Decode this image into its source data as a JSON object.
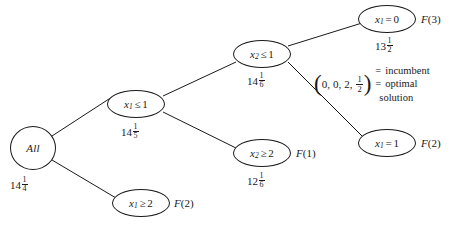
{
  "figure": {
    "background_color": "#ffffff",
    "line_color": "#1a1a1a"
  },
  "nodes": [
    {
      "id": "root",
      "label": "All",
      "label_plain": "All",
      "shape": "circle",
      "cx": 33,
      "cy": 148,
      "rx": 23,
      "ry": 22,
      "bound": {
        "whole": "14",
        "numer": "1",
        "denom": "4",
        "x": 10,
        "y": 176
      },
      "fn_label": null
    },
    {
      "id": "x1le1",
      "var": "x",
      "sub": "1",
      "op": "≤",
      "value": "1",
      "label_plain": "x1 ≤ 1",
      "shape": "ellipse",
      "cx": 136,
      "cy": 104,
      "rx": 29,
      "ry": 14,
      "bound": {
        "whole": "14",
        "numer": "1",
        "denom": "5",
        "x": 121,
        "y": 123
      },
      "fn_label": null
    },
    {
      "id": "x1ge2",
      "var": "x",
      "sub": "1",
      "op": "≥",
      "value": "2",
      "label_plain": "x1 ≥ 2",
      "shape": "ellipse",
      "cx": 141,
      "cy": 203,
      "rx": 29,
      "ry": 14,
      "bound": null,
      "fn_label": {
        "name": "F",
        "arg": "2",
        "x": 174,
        "y": 197
      }
    },
    {
      "id": "x2le1",
      "var": "x",
      "sub": "2",
      "op": "≤",
      "value": "1",
      "label_plain": "x2 ≤ 1",
      "shape": "ellipse",
      "cx": 262,
      "cy": 54,
      "rx": 29,
      "ry": 14,
      "bound": {
        "whole": "14",
        "numer": "1",
        "denom": "6",
        "x": 247,
        "y": 72
      },
      "fn_label": null
    },
    {
      "id": "x2ge2",
      "var": "x",
      "sub": "2",
      "op": "≥",
      "value": "2",
      "label_plain": "x2 ≥ 2",
      "shape": "ellipse",
      "cx": 262,
      "cy": 153,
      "rx": 29,
      "ry": 14,
      "bound": {
        "whole": "12",
        "numer": "1",
        "denom": "6",
        "x": 247,
        "y": 172
      },
      "fn_label": {
        "name": "F",
        "arg": "1",
        "x": 296,
        "y": 147
      }
    },
    {
      "id": "x1eq0",
      "var": "x",
      "sub": "1",
      "op": "=",
      "value": "0",
      "label_plain": "x1 = 0",
      "shape": "ellipse",
      "cx": 387,
      "cy": 19,
      "rx": 29,
      "ry": 14,
      "bound": {
        "whole": "13",
        "numer": "1",
        "denom": "2",
        "x": 375,
        "y": 37
      },
      "fn_label": {
        "name": "F",
        "arg": "3",
        "x": 421,
        "y": 13
      }
    },
    {
      "id": "x1eq1",
      "var": "x",
      "sub": "1",
      "op": "=",
      "value": "1",
      "label_plain": "x1 = 1",
      "shape": "ellipse",
      "cx": 387,
      "cy": 143,
      "rx": 29,
      "ry": 14,
      "bound": null,
      "fn_label": {
        "name": "F",
        "arg": "2",
        "x": 421,
        "y": 137
      }
    }
  ],
  "edges": [
    {
      "from": "root",
      "to": "x1le1",
      "x1": 52,
      "y1": 136,
      "x2": 112,
      "y2": 97
    },
    {
      "from": "root",
      "to": "x1ge2",
      "x1": 52,
      "y1": 160,
      "x2": 116,
      "y2": 198
    },
    {
      "from": "x1le1",
      "to": "x2le1",
      "x1": 163,
      "y1": 96,
      "x2": 236,
      "y2": 62
    },
    {
      "from": "x1le1",
      "to": "x2ge2",
      "x1": 163,
      "y1": 112,
      "x2": 236,
      "y2": 148
    },
    {
      "from": "x2le1",
      "to": "x1eq0",
      "x1": 288,
      "y1": 46,
      "x2": 362,
      "y2": 23
    },
    {
      "from": "x2le1",
      "to": "x1eq1",
      "x1": 288,
      "y1": 62,
      "x2": 362,
      "y2": 136
    }
  ],
  "annotation": {
    "id": "incumbent-note",
    "x": 314,
    "y": 64,
    "vector": {
      "open_paren": "(",
      "close_paren": ")",
      "components": [
        "0",
        "0",
        "2"
      ],
      "fraction": {
        "numer": "1",
        "denom": "2"
      },
      "separator": ","
    },
    "lines": [
      {
        "equals": "=",
        "text": "incumbent"
      },
      {
        "equals": "=",
        "text": "optimal"
      },
      {
        "equals": "",
        "text": "solution"
      }
    ],
    "plain_text": "(0, 0, 2, 1/2) = incumbent = optimal solution"
  }
}
